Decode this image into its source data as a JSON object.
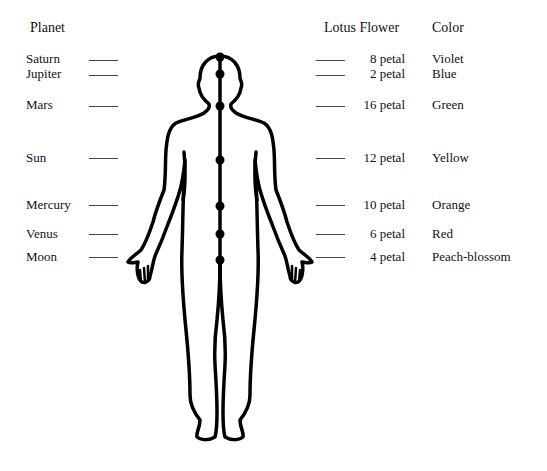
{
  "headers": {
    "planet": "Planet",
    "lotus": "Lotus Flower",
    "color": "Color"
  },
  "rows": [
    {
      "planet": "Saturn",
      "petals": "8 petal",
      "color": "Violet",
      "y": 59
    },
    {
      "planet": "Jupiter",
      "petals": "2 petal",
      "color": "Blue",
      "y": 74
    },
    {
      "planet": "Mars",
      "petals": "16 petal",
      "color": "Green",
      "y": 105
    },
    {
      "planet": "Sun",
      "petals": "12 petal",
      "color": "Yellow",
      "y": 157
    },
    {
      "planet": "Mercury",
      "petals": "10 petal",
      "color": "Orange",
      "y": 204
    },
    {
      "planet": "Venus",
      "petals": "6 petal",
      "color": "Red",
      "y": 233
    },
    {
      "planet": "Moon",
      "petals": "4 petal",
      "color": "Peach-blossom",
      "y": 256
    }
  ],
  "figure": {
    "chakra_points": 7
  }
}
